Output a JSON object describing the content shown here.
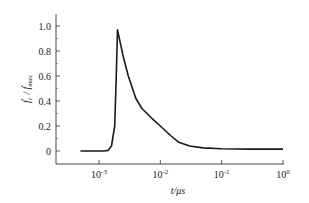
{
  "chart_data": {
    "type": "line",
    "title": "",
    "xlabel": "t/μs",
    "ylabel": "ḟr / ḟmax",
    "xscale": "log",
    "xlim": [
      0.0005,
      1
    ],
    "ylim": [
      -0.08,
      1.1
    ],
    "grid": false,
    "legend": null,
    "x_ticks": [
      {
        "base": "10",
        "exp": "-3",
        "value": 0.001
      },
      {
        "base": "10",
        "exp": "-2",
        "value": 0.01
      },
      {
        "base": "10",
        "exp": "-1",
        "value": 0.1
      },
      {
        "base": "10",
        "exp": "0",
        "value": 1
      }
    ],
    "y_ticks": [
      "0",
      "0.2",
      "0.4",
      "0.6",
      "0.8",
      "1.0"
    ],
    "y_tick_values": [
      0,
      0.2,
      0.4,
      0.6,
      0.8,
      1.0
    ],
    "series": [
      {
        "name": "normalized fracture rate",
        "color": "#1a1a1a",
        "x": [
          0.0005,
          0.0008,
          0.0012,
          0.0014,
          0.0016,
          0.0018,
          0.0019,
          0.002,
          0.0025,
          0.003,
          0.004,
          0.005,
          0.007,
          0.01,
          0.015,
          0.02,
          0.03,
          0.05,
          0.1,
          0.3,
          1.0
        ],
        "values": [
          0.0,
          0.0,
          0.0,
          0.005,
          0.04,
          0.2,
          0.55,
          0.97,
          0.75,
          0.6,
          0.42,
          0.34,
          0.27,
          0.2,
          0.12,
          0.07,
          0.04,
          0.025,
          0.018,
          0.015,
          0.015
        ]
      }
    ]
  },
  "axes": {
    "xlabel": "t/μs",
    "ylabel_main": "ḟ",
    "ylabel_sub": "r",
    "ylabel_den": "ḟ",
    "ylabel_den_sub": "max"
  }
}
